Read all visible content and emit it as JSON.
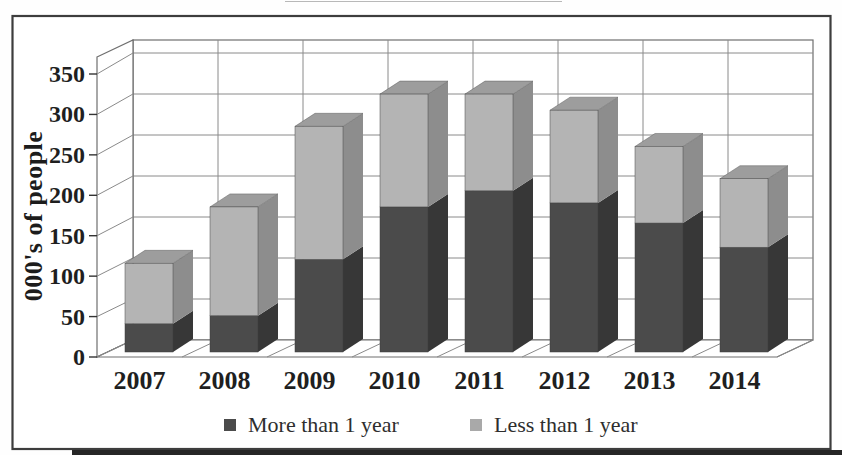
{
  "figure": {
    "frame_color": "#3d3d3d",
    "background": "#ffffff"
  },
  "chart_data": {
    "type": "bar",
    "variant": "3d-stacked-column",
    "title": "",
    "ylabel": "000's of people",
    "xlabel": "",
    "categories": [
      "2007",
      "2008",
      "2009",
      "2010",
      "2011",
      "2012",
      "2013",
      "2014"
    ],
    "series": [
      {
        "name": "More than 1 year",
        "values": [
          35,
          45,
          115,
          180,
          200,
          185,
          160,
          130
        ],
        "colors": {
          "front": "#4b4b4b",
          "side": "#373737",
          "legend": "#4b4b4b"
        }
      },
      {
        "name": "Less than 1 year",
        "values": [
          75,
          135,
          165,
          140,
          120,
          115,
          95,
          85
        ],
        "colors": {
          "front": "#b4b4b4",
          "side": "#8d8d8d",
          "top": "#9d9d9d",
          "legend": "#a9a9a9"
        }
      }
    ],
    "stacked_totals": [
      110,
      180,
      280,
      320,
      320,
      300,
      255,
      215
    ],
    "yticks": [
      0,
      50,
      100,
      150,
      200,
      250,
      300,
      350
    ],
    "ylim": [
      0,
      350
    ],
    "grid": true,
    "legend_position": "bottom",
    "text_color": "#1f1f1f",
    "grid_color": "#8a8a8a",
    "wall_color": "#6f6f6f"
  }
}
